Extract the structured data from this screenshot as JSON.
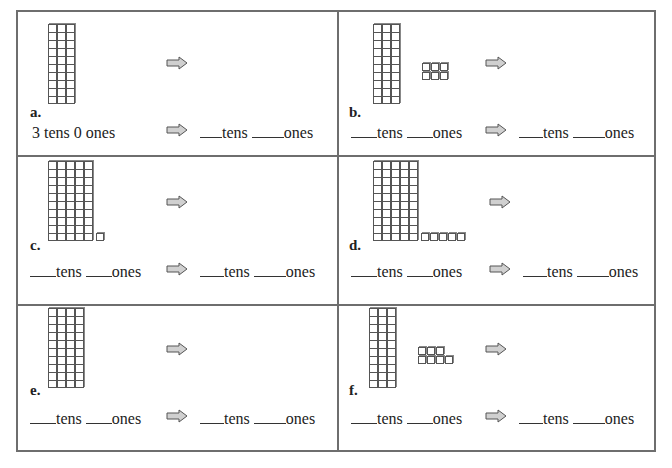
{
  "worksheet": {
    "cells": [
      {
        "label": "a.",
        "tens_rods": 3,
        "ones_cubes": 0,
        "cube_rows": [],
        "left": {
          "prefilled": true,
          "text": "3 tens  0 ones"
        },
        "right": {
          "tens_word": "tens",
          "ones_word": "ones"
        }
      },
      {
        "label": "b.",
        "tens_rods": 3,
        "ones_cubes": 6,
        "cube_rows": [
          3,
          3
        ],
        "left": {
          "prefilled": false,
          "tens_word": "tens",
          "ones_word": "ones"
        },
        "right": {
          "tens_word": "tens",
          "ones_word": "ones"
        }
      },
      {
        "label": "c.",
        "tens_rods": 5,
        "ones_cubes": 1,
        "cube_rows": [
          1
        ],
        "left": {
          "prefilled": false,
          "tens_word": "tens",
          "ones_word": "ones"
        },
        "right": {
          "tens_word": "tens",
          "ones_word": "ones"
        }
      },
      {
        "label": "d.",
        "tens_rods": 5,
        "ones_cubes": 5,
        "cube_rows": [
          5
        ],
        "left": {
          "prefilled": false,
          "tens_word": "tens",
          "ones_word": "ones"
        },
        "right": {
          "tens_word": "tens",
          "ones_word": "ones"
        }
      },
      {
        "label": "e.",
        "tens_rods": 4,
        "ones_cubes": 0,
        "cube_rows": [],
        "left": {
          "prefilled": false,
          "tens_word": "tens",
          "ones_word": "ones"
        },
        "right": {
          "tens_word": "tens",
          "ones_word": "ones"
        }
      },
      {
        "label": "f.",
        "tens_rods": 3,
        "ones_cubes": 7,
        "cube_rows": [
          3,
          4
        ],
        "left": {
          "prefilled": false,
          "tens_word": "tens",
          "ones_word": "ones"
        },
        "right": {
          "tens_word": "tens",
          "ones_word": "ones"
        }
      }
    ],
    "icons": {
      "arrow": "right-arrow-icon"
    },
    "colors": {
      "border": "#6e6e6e",
      "arrow_fill": "#d0d0d0",
      "arrow_stroke": "#555555"
    }
  }
}
